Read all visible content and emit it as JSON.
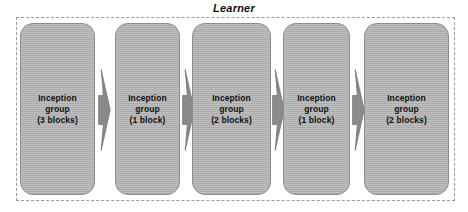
{
  "diagram": {
    "title": "Learner",
    "type": "pipeline-flow",
    "container_label": "Learner",
    "container_border_style": "dashed",
    "colors": {
      "block_fill": "#b2b2b2",
      "block_border": "#8d8d8d",
      "arrow_fill": "#8a8a8a",
      "arrow_border": "#6f6f6f",
      "container_border": "#9a9a9a",
      "text": "#111111",
      "background": "#ffffff"
    },
    "blocks": [
      {
        "id": "inception-group-1",
        "name": "Inception group",
        "blocks_count": 3,
        "count_label": "(3 blocks)",
        "label": "Inception\ngroup\n(3 blocks)"
      },
      {
        "id": "inception-group-2",
        "name": "Inception group",
        "blocks_count": 1,
        "count_label": "(1 block)",
        "label": "Inception\ngroup\n(1 block)"
      },
      {
        "id": "inception-group-3",
        "name": "Inception group",
        "blocks_count": 2,
        "count_label": "(2 blocks)",
        "label": "Inception\ngroup\n(2 blocks)"
      },
      {
        "id": "inception-group-4",
        "name": "Inception group",
        "blocks_count": 1,
        "count_label": "(1 block)",
        "label": "Inception\ngroup\n(1 block)"
      },
      {
        "id": "inception-group-5",
        "name": "Inception group",
        "blocks_count": 2,
        "count_label": "(2 blocks)",
        "label": "Inception\ngroup\n(2 blocks)"
      }
    ],
    "arrows": [
      {
        "id": "arrow-1",
        "from": "inception-group-1",
        "to": "inception-group-2",
        "direction": "right"
      },
      {
        "id": "arrow-2",
        "from": "inception-group-2",
        "to": "inception-group-3",
        "direction": "right"
      },
      {
        "id": "arrow-3",
        "from": "inception-group-3",
        "to": "inception-group-4",
        "direction": "right"
      },
      {
        "id": "arrow-4",
        "from": "inception-group-4",
        "to": "inception-group-5",
        "direction": "right"
      }
    ]
  }
}
